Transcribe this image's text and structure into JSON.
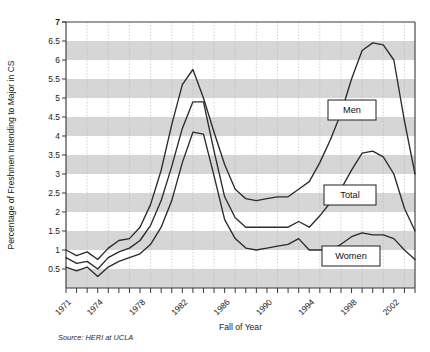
{
  "chart_data": {
    "type": "line",
    "title": "",
    "xlabel": "Fall of Year",
    "ylabel": "Percentage of Freshmen Intending to Major in CS",
    "source_note": "Source: HERI at UCLA",
    "grid": true,
    "legend_position": "inline-labels",
    "xlim": [
      1971,
      2004
    ],
    "ylim": [
      0,
      7
    ],
    "ytick_step": 0.5,
    "yticks": [
      "0.5",
      "1",
      "1.5",
      "2",
      "2.5",
      "3",
      "3.5",
      "4",
      "4.5",
      "5",
      "5.5",
      "6",
      "6.5",
      "7"
    ],
    "xticks_labeled": [
      "1971",
      "1974",
      "1978",
      "1982",
      "1986",
      "1990",
      "1994",
      "1998",
      "2002"
    ],
    "x": [
      1971,
      1972,
      1973,
      1974,
      1975,
      1976,
      1977,
      1978,
      1979,
      1980,
      1981,
      1982,
      1983,
      1984,
      1985,
      1986,
      1987,
      1988,
      1989,
      1990,
      1991,
      1992,
      1993,
      1994,
      1995,
      1996,
      1997,
      1998,
      1999,
      2000,
      2001,
      2002,
      2003,
      2004
    ],
    "series": [
      {
        "name": "Men",
        "label": "Men",
        "values": [
          1.0,
          0.85,
          0.95,
          0.75,
          1.05,
          1.25,
          1.3,
          1.6,
          2.2,
          3.1,
          4.3,
          5.35,
          5.75,
          5.0,
          4.1,
          3.25,
          2.6,
          2.35,
          2.3,
          2.35,
          2.4,
          2.4,
          2.6,
          2.8,
          3.3,
          3.9,
          4.6,
          5.5,
          6.25,
          6.45,
          6.4,
          6.0,
          4.4,
          3.0
        ]
      },
      {
        "name": "Total",
        "label": "Total",
        "values": [
          0.8,
          0.65,
          0.7,
          0.5,
          0.8,
          0.95,
          1.05,
          1.25,
          1.65,
          2.3,
          3.2,
          4.2,
          4.9,
          4.9,
          3.6,
          2.4,
          1.85,
          1.6,
          1.6,
          1.6,
          1.6,
          1.6,
          1.75,
          1.6,
          1.9,
          2.25,
          2.6,
          3.1,
          3.55,
          3.6,
          3.45,
          3.0,
          2.1,
          1.5
        ]
      },
      {
        "name": "Women",
        "label": "Women",
        "values": [
          0.55,
          0.45,
          0.55,
          0.3,
          0.55,
          0.7,
          0.8,
          0.9,
          1.15,
          1.6,
          2.3,
          3.3,
          4.1,
          4.05,
          2.95,
          1.8,
          1.3,
          1.05,
          1.0,
          1.05,
          1.1,
          1.15,
          1.3,
          1.0,
          1.0,
          1.0,
          1.15,
          1.35,
          1.45,
          1.4,
          1.4,
          1.3,
          1.0,
          0.75
        ]
      }
    ],
    "legend_labels": [
      {
        "name": "Men",
        "text": "Men"
      },
      {
        "name": "Total",
        "text": "Total"
      },
      {
        "name": "Women",
        "text": "Women"
      }
    ],
    "colors": {
      "line": "#2b2b2b",
      "band": "#d6d6d6",
      "axis": "#3a3a3a",
      "grid": "#b9b9b9",
      "background": "#ffffff"
    }
  }
}
